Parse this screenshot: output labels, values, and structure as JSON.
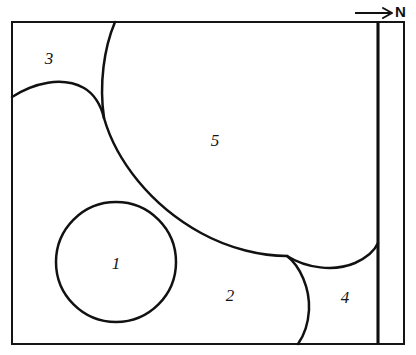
{
  "figure": {
    "width": 416,
    "height": 355,
    "background_color": "#ffffff",
    "line_color": "#111111"
  },
  "orientation": {
    "label": "N",
    "icon": "north-arrow-icon",
    "direction": "right",
    "label_x": 396,
    "label_y": 13,
    "shaft_x1": 355,
    "shaft_x2": 391,
    "shaft_y": 13
  },
  "frame": {
    "x": 12,
    "y": 22,
    "width": 392,
    "height": 322,
    "stroke_width": 2
  },
  "divider": {
    "name": "vertical-boundary-line",
    "x": 378,
    "y1": 22,
    "y2": 344,
    "stroke_width": 3.1
  },
  "regions": [
    {
      "id": "region-1",
      "label": "1",
      "label_x": 116,
      "label_y": 265,
      "shape": "circle",
      "center_x": 116,
      "center_y": 262,
      "radius": 60
    },
    {
      "id": "region-2",
      "label": "2",
      "label_x": 230,
      "label_y": 297
    },
    {
      "id": "region-3",
      "label": "3",
      "label_x": 49,
      "label_y": 60
    },
    {
      "id": "region-4",
      "label": "4",
      "label_x": 345,
      "label_y": 299
    },
    {
      "id": "region-5",
      "label": "5",
      "label_x": 215,
      "label_y": 142
    }
  ],
  "boundaries": [
    {
      "id": "boundary-region3-arc",
      "description": "arc from left border rising right to cusp",
      "path": "M 12,97 C 34,83 62,76 84,88 C 96,95 101,106 104,118"
    },
    {
      "id": "boundary-top-steep",
      "description": "steep curve from top border down to cusp",
      "path": "M 115,22 C 104,48 99,84 104,118"
    },
    {
      "id": "boundary-main-sweep",
      "description": "main sweeping curve from cusp to branch point",
      "path": "M 104,118 C 116,160 150,205 201,233 C 230,249 262,256 287,256"
    },
    {
      "id": "boundary-region4-left",
      "description": "curve from branch point down to bottom border",
      "path": "M 287,256 C 300,266 310,288 309,310 C 308,326 303,337 298,344"
    },
    {
      "id": "boundary-region5-right",
      "description": "curve from branch point dipping right up to vertical line",
      "path": "M 287,256 C 306,268 334,272 355,263 C 368,257 375,250 378,243"
    }
  ]
}
